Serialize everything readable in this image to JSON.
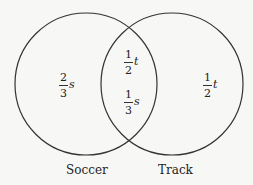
{
  "diagram": {
    "type": "venn",
    "stroke_color": "#333333",
    "sets": [
      {
        "name": "Soccer",
        "label": "Soccer"
      },
      {
        "name": "Track",
        "label": "Track"
      }
    ],
    "regions": {
      "soccer_only": {
        "numerator": "2",
        "denominator": "3",
        "variable": "s"
      },
      "intersection": [
        {
          "numerator": "1",
          "denominator": "2",
          "variable": "t"
        },
        {
          "numerator": "1",
          "denominator": "3",
          "variable": "s"
        }
      ],
      "track_only": {
        "numerator": "1",
        "denominator": "2",
        "variable": "t"
      }
    }
  }
}
